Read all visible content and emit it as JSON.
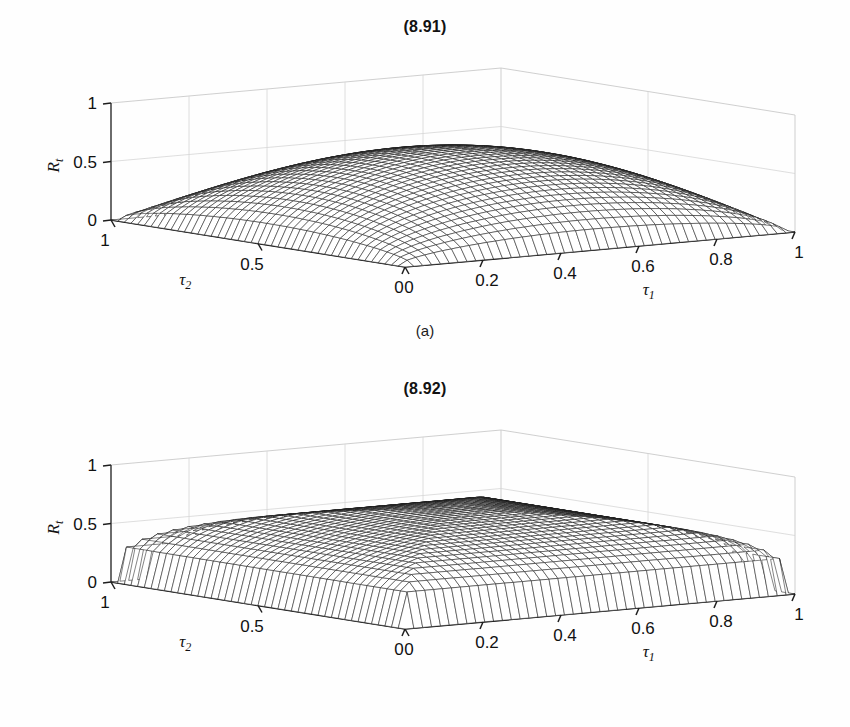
{
  "figure": {
    "background": "#ffffff",
    "ink": "#111111"
  },
  "panels": [
    {
      "id": "a",
      "title": "(8.91)",
      "caption": "(a)",
      "chart_data": {
        "type": "surface",
        "title": "(8.91)",
        "xlabel": "τ₁",
        "ylabel": "τ₂",
        "zlabel": "Rₜ",
        "xlim": [
          0,
          1
        ],
        "ylim": [
          0,
          1
        ],
        "zlim": [
          0,
          1
        ],
        "xticks": [
          "0",
          "0.2",
          "0.4",
          "0.6",
          "0.8",
          "1"
        ],
        "xtick_values": [
          0,
          0.2,
          0.4,
          0.6,
          0.8,
          1
        ],
        "yticks": [
          "1",
          "0.5",
          "0"
        ],
        "ytick_values": [
          1,
          0.5,
          0
        ],
        "zticks": [
          "0",
          "0.5",
          "1"
        ],
        "ztick_values": [
          0,
          0.5,
          1
        ],
        "grid": true,
        "legend": "none",
        "surface_kind": "algebraic-product-dome",
        "z_peak": 0.63,
        "z_peak_at": [
          0.5,
          0.5
        ],
        "description": "Smooth dome, R_t = sqrt(t1*(1-t1)) * sqrt(t2*(1-t2)) normalised, flat-topped ridge, zero on all four boundaries",
        "samples": {
          "tau1": [
            0,
            0.1,
            0.2,
            0.3,
            0.4,
            0.5,
            0.6,
            0.7,
            0.8,
            0.9,
            1
          ],
          "tau2": [
            0,
            0.1,
            0.2,
            0.3,
            0.4,
            0.5,
            0.6,
            0.7,
            0.8,
            0.9,
            1
          ],
          "Rt": [
            [
              0,
              0,
              0,
              0,
              0,
              0,
              0,
              0,
              0,
              0,
              0
            ],
            [
              0,
              0.24,
              0.33,
              0.38,
              0.4,
              0.41,
              0.4,
              0.38,
              0.33,
              0.24,
              0
            ],
            [
              0,
              0.33,
              0.45,
              0.52,
              0.55,
              0.56,
              0.55,
              0.52,
              0.45,
              0.33,
              0
            ],
            [
              0,
              0.38,
              0.52,
              0.59,
              0.62,
              0.63,
              0.62,
              0.59,
              0.52,
              0.38,
              0
            ],
            [
              0,
              0.4,
              0.55,
              0.62,
              0.65,
              0.66,
              0.65,
              0.62,
              0.55,
              0.4,
              0
            ],
            [
              0,
              0.41,
              0.56,
              0.63,
              0.66,
              0.67,
              0.66,
              0.63,
              0.56,
              0.41,
              0
            ],
            [
              0,
              0.4,
              0.55,
              0.62,
              0.65,
              0.66,
              0.65,
              0.62,
              0.55,
              0.4,
              0
            ],
            [
              0,
              0.38,
              0.52,
              0.59,
              0.62,
              0.63,
              0.62,
              0.59,
              0.52,
              0.38,
              0
            ],
            [
              0,
              0.33,
              0.45,
              0.52,
              0.55,
              0.56,
              0.55,
              0.52,
              0.45,
              0.33,
              0
            ],
            [
              0,
              0.24,
              0.33,
              0.38,
              0.4,
              0.41,
              0.4,
              0.38,
              0.33,
              0.24,
              0
            ],
            [
              0,
              0,
              0,
              0,
              0,
              0,
              0,
              0,
              0,
              0,
              0
            ]
          ]
        }
      }
    },
    {
      "id": "b",
      "title": "(8.92)",
      "caption": "(b)",
      "chart_data": {
        "type": "surface",
        "title": "(8.92)",
        "xlabel": "τ₁",
        "ylabel": "τ₂",
        "zlabel": "Rₜ",
        "xlim": [
          0,
          1
        ],
        "ylim": [
          0,
          1
        ],
        "zlim": [
          0,
          1
        ],
        "xticks": [
          "0",
          "0.2",
          "0.4",
          "0.6",
          "0.8",
          "1"
        ],
        "xtick_values": [
          0,
          0.2,
          0.4,
          0.6,
          0.8,
          1
        ],
        "yticks": [
          "1",
          "0.5",
          "0"
        ],
        "ytick_values": [
          1,
          0.5,
          0
        ],
        "zticks": [
          "0",
          "0.5",
          "1"
        ],
        "ztick_values": [
          0,
          0.5,
          1
        ],
        "grid": true,
        "legend": "none",
        "surface_kind": "minimum-dome-with-crease",
        "z_peak": 0.66,
        "z_peak_at": [
          0.5,
          0.5
        ],
        "description": "Dome built from a minimum operator, producing a sharp V-shaped crease along the diagonals toward the front corner; steeper skirt walls than (a)",
        "samples": {
          "tau1": [
            0,
            0.1,
            0.2,
            0.3,
            0.4,
            0.5,
            0.6,
            0.7,
            0.8,
            0.9,
            1
          ],
          "tau2": [
            0,
            0.1,
            0.2,
            0.3,
            0.4,
            0.5,
            0.6,
            0.7,
            0.8,
            0.9,
            1
          ],
          "Rt": [
            [
              0,
              0,
              0,
              0,
              0,
              0,
              0,
              0,
              0,
              0,
              0
            ],
            [
              0,
              0.3,
              0.3,
              0.3,
              0.3,
              0.3,
              0.3,
              0.3,
              0.3,
              0.3,
              0
            ],
            [
              0,
              0.3,
              0.4,
              0.4,
              0.4,
              0.4,
              0.4,
              0.4,
              0.4,
              0.3,
              0
            ],
            [
              0,
              0.3,
              0.4,
              0.46,
              0.46,
              0.46,
              0.46,
              0.46,
              0.4,
              0.3,
              0
            ],
            [
              0,
              0.3,
              0.4,
              0.46,
              0.49,
              0.49,
              0.49,
              0.46,
              0.4,
              0.3,
              0
            ],
            [
              0,
              0.3,
              0.4,
              0.46,
              0.49,
              0.5,
              0.49,
              0.46,
              0.4,
              0.3,
              0
            ],
            [
              0,
              0.3,
              0.4,
              0.46,
              0.49,
              0.49,
              0.49,
              0.46,
              0.4,
              0.3,
              0
            ],
            [
              0,
              0.3,
              0.4,
              0.46,
              0.46,
              0.46,
              0.46,
              0.46,
              0.4,
              0.3,
              0
            ],
            [
              0,
              0.3,
              0.4,
              0.4,
              0.4,
              0.4,
              0.4,
              0.4,
              0.4,
              0.3,
              0
            ],
            [
              0,
              0.3,
              0.3,
              0.3,
              0.3,
              0.3,
              0.3,
              0.3,
              0.3,
              0.3,
              0
            ],
            [
              0,
              0,
              0,
              0,
              0,
              0,
              0,
              0,
              0,
              0,
              0
            ]
          ]
        }
      }
    }
  ]
}
